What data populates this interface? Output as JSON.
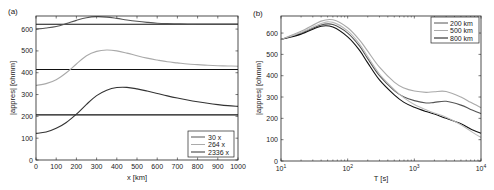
{
  "chart_data": [
    {
      "panel": "(a)",
      "type": "line",
      "title": "",
      "xlabel": "x [km]",
      "ylabel": "|appres| [ohmm]",
      "xlim": [
        0,
        1000
      ],
      "ylim": [
        0,
        660
      ],
      "xticks": [
        0,
        100,
        200,
        300,
        400,
        500,
        600,
        700,
        800,
        900,
        1000
      ],
      "yticks": [
        0,
        100,
        200,
        300,
        400,
        500,
        600
      ],
      "grid": false,
      "legend_position": "lower right",
      "x": [
        0,
        50,
        100,
        150,
        200,
        250,
        300,
        350,
        400,
        450,
        500,
        550,
        600,
        650,
        700,
        750,
        800,
        850,
        900,
        950,
        1000
      ],
      "series": [
        {
          "name": "30 x",
          "color": "#555555",
          "values": [
            600,
            605,
            612,
            625,
            640,
            652,
            657,
            655,
            649,
            642,
            636,
            631,
            627,
            625,
            624,
            623,
            623,
            623,
            623,
            623,
            623
          ]
        },
        {
          "name": "264 x",
          "color": "#aaaaaa",
          "values": [
            342,
            350,
            368,
            400,
            440,
            478,
            498,
            504,
            500,
            490,
            478,
            467,
            458,
            450,
            445,
            440,
            437,
            434,
            432,
            431,
            430
          ]
        },
        {
          "name": "2336 x",
          "color": "#333333",
          "values": [
            122,
            128,
            145,
            172,
            210,
            255,
            295,
            320,
            332,
            333,
            326,
            316,
            305,
            294,
            284,
            275,
            267,
            260,
            254,
            249,
            246
          ]
        }
      ],
      "reference_lines": [
        {
          "y": 622,
          "color": "#111111"
        },
        {
          "y": 415,
          "color": "#111111"
        },
        {
          "y": 207,
          "color": "#111111"
        }
      ]
    },
    {
      "panel": "(b)",
      "type": "line",
      "title": "",
      "xlabel": "T [s]",
      "ylabel": "|appres| [ohmm]",
      "xscale": "log",
      "xlim": [
        10,
        10000
      ],
      "ylim": [
        0,
        680
      ],
      "xticks": [
        10,
        100,
        1000,
        10000
      ],
      "xtick_labels": [
        "10^1",
        "10^2",
        "10^3",
        "10^4"
      ],
      "yticks": [
        0,
        100,
        200,
        300,
        400,
        500,
        600
      ],
      "grid": false,
      "legend_position": "upper right",
      "x": [
        10,
        20,
        40,
        60,
        100,
        150,
        200,
        300,
        500,
        700,
        1000,
        1500,
        2000,
        3000,
        5000,
        7000,
        10000
      ],
      "series": [
        {
          "name": "200 km",
          "color": "#555555",
          "values": [
            570,
            600,
            638,
            640,
            600,
            540,
            480,
            400,
            330,
            300,
            283,
            272,
            275,
            280,
            262,
            242,
            222
          ]
        },
        {
          "name": "500 km",
          "color": "#aaaaaa",
          "values": [
            570,
            608,
            656,
            662,
            625,
            568,
            515,
            440,
            370,
            342,
            328,
            322,
            325,
            326,
            300,
            275,
            250
          ]
        },
        {
          "name": "800 km",
          "color": "#111111",
          "values": [
            570,
            595,
            632,
            628,
            582,
            520,
            460,
            380,
            310,
            275,
            252,
            232,
            220,
            200,
            175,
            150,
            130
          ]
        },
        {
          "name": "",
          "color": "#bbbbbb",
          "values": [
            570,
            603,
            645,
            650,
            610,
            550,
            490,
            408,
            335,
            296,
            265,
            240,
            225,
            205,
            170,
            140,
            110
          ]
        }
      ]
    }
  ],
  "panels": {
    "a": {
      "label": "(a)",
      "xlabel": "x [km]",
      "ylabel": "|appres| [ohmm]",
      "legend": [
        "30 x",
        "264 x",
        "2336 x"
      ]
    },
    "b": {
      "label": "(b)",
      "xlabel": "T [s]",
      "ylabel": "|appres| [ohmm]",
      "legend": [
        "200 km",
        "500 km",
        "800 km"
      ]
    }
  }
}
